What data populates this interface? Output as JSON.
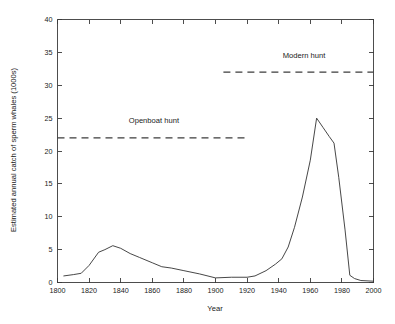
{
  "chart_data": {
    "type": "line",
    "title": "",
    "xlabel": "Year",
    "ylabel": "Estimated annual catch of sperm whales (1000s)",
    "xlim": [
      1800,
      2000
    ],
    "ylim": [
      0,
      40
    ],
    "xticks": [
      1800,
      1820,
      1840,
      1860,
      1880,
      1900,
      1920,
      1940,
      1960,
      1980,
      2000
    ],
    "xticklabels": [
      "1800",
      "1820",
      "1840",
      "1860",
      "1880",
      "1900",
      "1920",
      "1940",
      "1960",
      "1980",
      "2000"
    ],
    "yticks": [
      0,
      5,
      10,
      15,
      20,
      25,
      30,
      35,
      40
    ],
    "yticklabels": [
      "0",
      "5",
      "10",
      "15",
      "20",
      "25",
      "30",
      "35",
      "40"
    ],
    "grid": false,
    "legend": false,
    "series": [
      {
        "name": "Estimated annual catch of sperm whales",
        "style": "solid",
        "color": "#3d3d3d",
        "x": [
          1804,
          1810,
          1815,
          1820,
          1826,
          1830,
          1835,
          1840,
          1846,
          1852,
          1860,
          1866,
          1872,
          1880,
          1890,
          1900,
          1910,
          1920,
          1925,
          1932,
          1938,
          1942,
          1946,
          1950,
          1955,
          1960,
          1964,
          1968,
          1972,
          1975,
          1978,
          1982,
          1985,
          1988,
          1992,
          2000
        ],
        "y": [
          1.0,
          1.2,
          1.4,
          2.6,
          4.6,
          5.0,
          5.6,
          5.2,
          4.4,
          3.8,
          3.0,
          2.4,
          2.2,
          1.8,
          1.3,
          0.7,
          0.8,
          0.8,
          1.0,
          1.8,
          2.8,
          3.6,
          5.4,
          8.4,
          13.0,
          18.6,
          25.0,
          23.6,
          22.2,
          21.2,
          16.0,
          8.0,
          1.1,
          0.6,
          0.3,
          0.2
        ]
      }
    ],
    "annotations": [
      {
        "name": "openboat-hunt",
        "label": "Openboat hunt",
        "style": "dashed",
        "y": 22,
        "x_start": 1800,
        "x_end": 1919,
        "label_x": 1861,
        "label_y": 24.2
      },
      {
        "name": "modern-hunt",
        "label": "Modern hunt",
        "style": "dashed",
        "y": 32,
        "x_start": 1905,
        "x_end": 2000,
        "label_x": 1956,
        "label_y": 34.2
      }
    ]
  }
}
